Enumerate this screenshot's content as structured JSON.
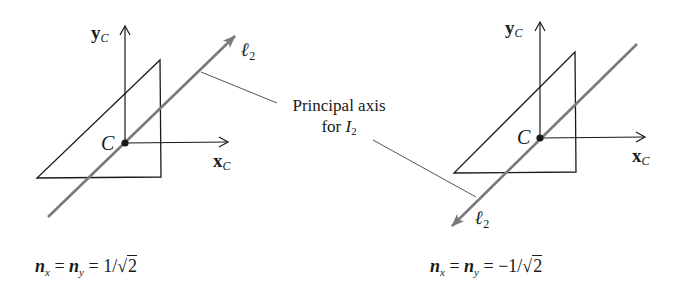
{
  "colors": {
    "ink": "#1a1a1a",
    "principal_axis": "#7a7a7a",
    "leader": "#555555"
  },
  "callout": {
    "line1": "Principal axis",
    "line2_prefix": "for ",
    "line2_symbol": "I",
    "line2_sub": "2"
  },
  "left_diagram": {
    "y_axis": {
      "base": "y",
      "sub": "C"
    },
    "x_axis": {
      "base": "x",
      "sub": "C"
    },
    "centroid": "C",
    "principal_line": {
      "base": "ℓ",
      "sub": "2"
    },
    "formula": {
      "lhs1": "n",
      "lhs1_sub": "x",
      "eq1": " = ",
      "lhs2": "n",
      "lhs2_sub": "y",
      "eq2": " = ",
      "value_prefix": "1/√",
      "radicand": "2"
    }
  },
  "right_diagram": {
    "y_axis": {
      "base": "y",
      "sub": "C"
    },
    "x_axis": {
      "base": "x",
      "sub": "C"
    },
    "centroid": "C",
    "principal_line": {
      "base": "ℓ",
      "sub": "2"
    },
    "formula": {
      "lhs1": "n",
      "lhs1_sub": "x",
      "eq1": " = ",
      "lhs2": "n",
      "lhs2_sub": "y",
      "eq2": " = ",
      "value_prefix": "−1/√",
      "radicand": "2"
    }
  }
}
